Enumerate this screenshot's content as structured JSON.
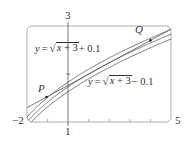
{
  "chart_data": {
    "type": "line",
    "title": "",
    "xlabel": "",
    "ylabel": "",
    "xlim": [
      -2,
      5
    ],
    "ylim": [
      1,
      3
    ],
    "grid": false,
    "frame": "rounded-box",
    "x_axis_ticks": [
      -1,
      1,
      2,
      3,
      4
    ],
    "y_axis_ticks": [
      2
    ],
    "corner_labels": {
      "x_min": "−2",
      "x_max": "5",
      "y_min": "1",
      "y_max": "3"
    },
    "series": [
      {
        "name": "y = √(x+3)",
        "function": "sqrt(x+3)",
        "offset": 0
      },
      {
        "name": "y = √(x+3) + 0.1",
        "function": "sqrt(x+3)+0.1",
        "offset": 0.1
      },
      {
        "name": "y = √(x+3) − 0.1",
        "function": "sqrt(x+3)-0.1",
        "offset": -0.1
      },
      {
        "name": "secant line PQ",
        "type": "line",
        "through": [
          "P",
          "Q"
        ]
      }
    ],
    "points": {
      "P": {
        "label": "P",
        "x": -1.05,
        "y": 1.52
      },
      "Q": {
        "label": "Q",
        "x": 4.0,
        "y": 2.7
      }
    },
    "annotations": [
      {
        "text": "y = √(x + 3) + 0.1",
        "series": "upper"
      },
      {
        "text": "y = √(x + 3) − 0.1",
        "series": "lower"
      }
    ]
  },
  "labels": {
    "x_min": "−2",
    "x_max": "5",
    "y_min": "1",
    "y_max": "3",
    "P": "P",
    "Q": "Q",
    "upper_eq": {
      "y": "y",
      "eq": "=",
      "rad_var": "x",
      "rad_rest": " + 3",
      "tail": " + 0.1"
    },
    "lower_eq": {
      "y": "y",
      "eq": "=",
      "rad_var": "x",
      "rad_rest": " + 3",
      "tail": " − 0.1"
    }
  },
  "colors": {
    "curve": "#555555",
    "frame": "#9a9a9a",
    "axis": "#555555",
    "text": "#333333"
  }
}
